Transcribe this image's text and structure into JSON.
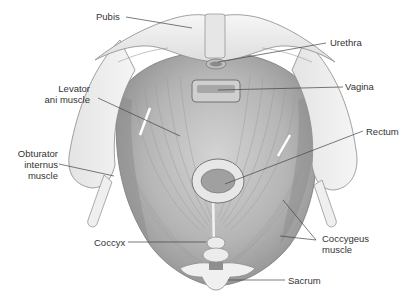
{
  "figure": {
    "labels": [
      {
        "id": "pubis",
        "text": "Pubis",
        "lines": [
          "Pubis"
        ]
      },
      {
        "id": "urethra",
        "text": "Urethra",
        "lines": [
          "Urethra"
        ]
      },
      {
        "id": "levator",
        "text": "Levator ani muscle",
        "lines": [
          "Levator",
          "ani muscle"
        ]
      },
      {
        "id": "vagina",
        "text": "Vagina",
        "lines": [
          "Vagina"
        ]
      },
      {
        "id": "rectum",
        "text": "Rectum",
        "lines": [
          "Rectum"
        ]
      },
      {
        "id": "obturator",
        "text": "Obturator internus muscle",
        "lines": [
          "Obturator",
          "internus",
          "muscle"
        ]
      },
      {
        "id": "coccyx",
        "text": "Coccyx",
        "lines": [
          "Coccyx"
        ]
      },
      {
        "id": "coccygeus",
        "text": "Coccygeus muscle",
        "lines": [
          "Coccygeus",
          "muscle"
        ]
      },
      {
        "id": "sacrum",
        "text": "Sacrum",
        "lines": [
          "Sacrum"
        ]
      }
    ],
    "colors": {
      "background": "#ffffff",
      "bone": "#eeeeee",
      "bone_outline": "#8a8a8a",
      "muscle_light": "#c9c9c9",
      "muscle_dark": "#8f8f8f",
      "leader_line": "#444444",
      "label_text": "#333333"
    }
  }
}
